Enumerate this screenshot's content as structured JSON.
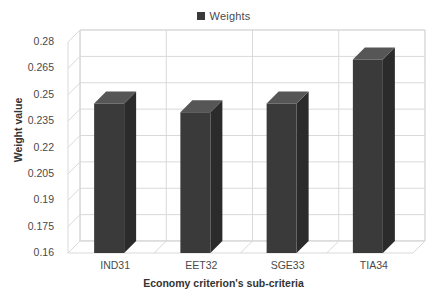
{
  "legend": {
    "marker": "square-marker-icon",
    "label": "Weights",
    "position": "top-center",
    "color": "#3a3a3a"
  },
  "axes": {
    "y_title": "Weight value",
    "x_title": "Economy criterion's sub-criteria",
    "y_ticks": [
      "0.28",
      "0.265",
      "0.25",
      "0.235",
      "0.22",
      "0.205",
      "0.19",
      "0.175",
      "0.16"
    ],
    "x_ticks": [
      "IND31",
      "EET32",
      "SGE33",
      "TIA34"
    ]
  },
  "data_labels": [
    "0.245",
    "0.24",
    "0.245",
    "0.27"
  ],
  "colors": {
    "bar_front": "#3a3a3a",
    "bar_top": "#565656",
    "bar_side": "#2b2b2b",
    "grid": "#d9d9d9",
    "wall": "#ffffff",
    "background": "#ffffff",
    "text": "#4a4a4a"
  },
  "chart_data": {
    "type": "bar",
    "title": "",
    "subtitle": "",
    "categories": [
      "IND31",
      "EET32",
      "SGE33",
      "TIA34"
    ],
    "values": [
      0.245,
      0.24,
      0.245,
      0.27
    ],
    "series": [
      {
        "name": "Weights",
        "values": [
          0.245,
          0.24,
          0.245,
          0.27
        ]
      }
    ],
    "xlabel": "Economy criterion's sub-criteria",
    "ylabel": "Weight value",
    "ylim": [
      0.16,
      0.28
    ],
    "ytick_step": 0.015,
    "yticks": [
      0.16,
      0.175,
      0.19,
      0.205,
      0.22,
      0.235,
      0.25,
      0.265,
      0.28
    ],
    "grid": true,
    "legend": "top-center",
    "three_d": true,
    "data_labels": [
      0.245,
      0.24,
      0.245,
      0.27
    ]
  }
}
